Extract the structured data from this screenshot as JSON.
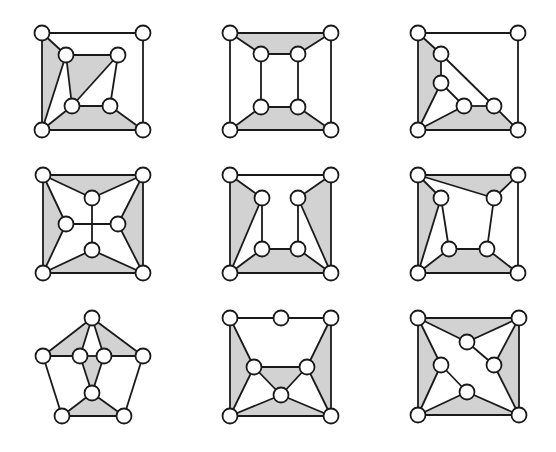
{
  "style": {
    "background": "#ffffff",
    "stroke": "#1a1a1a",
    "face_fill": "#d2d2d2",
    "node_fill": "#ffffff",
    "node_radius": 7.5,
    "stroke_width": 1.8
  },
  "graphs": [
    {
      "id": "g1",
      "nodes": [
        [
          42,
          33
        ],
        [
          143,
          33
        ],
        [
          42,
          130
        ],
        [
          143,
          130
        ],
        [
          66,
          55
        ],
        [
          118,
          55
        ],
        [
          72,
          106
        ],
        [
          110,
          106
        ]
      ],
      "faces": [
        [
          0,
          4,
          2
        ],
        [
          4,
          5,
          6
        ],
        [
          2,
          6,
          7,
          3
        ]
      ],
      "edges": [
        [
          0,
          1
        ],
        [
          1,
          3
        ],
        [
          3,
          2
        ],
        [
          2,
          0
        ],
        [
          0,
          4
        ],
        [
          4,
          5
        ],
        [
          5,
          7
        ],
        [
          7,
          6
        ],
        [
          6,
          4
        ],
        [
          5,
          6
        ],
        [
          4,
          2
        ],
        [
          2,
          6
        ],
        [
          7,
          3
        ]
      ]
    },
    {
      "id": "g2",
      "nodes": [
        [
          230,
          33
        ],
        [
          331,
          33
        ],
        [
          230,
          130
        ],
        [
          331,
          130
        ],
        [
          261,
          54
        ],
        [
          298,
          54
        ],
        [
          261,
          107
        ],
        [
          298,
          107
        ]
      ],
      "faces": [
        [
          0,
          1,
          5,
          4
        ],
        [
          6,
          7,
          3,
          2
        ]
      ],
      "edges": [
        [
          0,
          1
        ],
        [
          1,
          3
        ],
        [
          3,
          2
        ],
        [
          2,
          0
        ],
        [
          0,
          4
        ],
        [
          1,
          5
        ],
        [
          4,
          5
        ],
        [
          4,
          6
        ],
        [
          5,
          7
        ],
        [
          6,
          7
        ],
        [
          6,
          2
        ],
        [
          7,
          3
        ]
      ]
    },
    {
      "id": "g3",
      "nodes": [
        [
          418,
          33
        ],
        [
          518,
          33
        ],
        [
          418,
          130
        ],
        [
          518,
          130
        ],
        [
          441,
          54
        ],
        [
          441,
          83
        ],
        [
          464,
          106
        ],
        [
          494,
          106
        ]
      ],
      "faces": [
        [
          0,
          4,
          5,
          2
        ],
        [
          2,
          6,
          7,
          3
        ]
      ],
      "edges": [
        [
          0,
          1
        ],
        [
          1,
          3
        ],
        [
          3,
          2
        ],
        [
          2,
          0
        ],
        [
          0,
          4
        ],
        [
          4,
          5
        ],
        [
          4,
          7
        ],
        [
          5,
          6
        ],
        [
          6,
          7
        ],
        [
          5,
          2
        ],
        [
          6,
          2
        ],
        [
          7,
          3
        ]
      ]
    },
    {
      "id": "g4",
      "nodes": [
        [
          43,
          175
        ],
        [
          143,
          175
        ],
        [
          43,
          273
        ],
        [
          143,
          273
        ],
        [
          92,
          198
        ],
        [
          66,
          224
        ],
        [
          118,
          224
        ],
        [
          92,
          250
        ]
      ],
      "faces": [
        [
          0,
          1,
          4
        ],
        [
          0,
          5,
          2
        ],
        [
          1,
          3,
          6
        ],
        [
          2,
          7,
          3
        ]
      ],
      "edges": [
        [
          0,
          1
        ],
        [
          1,
          3
        ],
        [
          3,
          2
        ],
        [
          2,
          0
        ],
        [
          0,
          4
        ],
        [
          1,
          4
        ],
        [
          0,
          5
        ],
        [
          2,
          5
        ],
        [
          1,
          6
        ],
        [
          3,
          6
        ],
        [
          2,
          7
        ],
        [
          3,
          7
        ],
        [
          4,
          7
        ],
        [
          5,
          6
        ]
      ]
    },
    {
      "id": "g5",
      "nodes": [
        [
          230,
          175
        ],
        [
          331,
          175
        ],
        [
          230,
          273
        ],
        [
          331,
          273
        ],
        [
          262,
          198
        ],
        [
          298,
          198
        ],
        [
          262,
          249
        ],
        [
          298,
          249
        ]
      ],
      "faces": [
        [
          0,
          4,
          2
        ],
        [
          1,
          3,
          5
        ],
        [
          2,
          6,
          7,
          3
        ]
      ],
      "edges": [
        [
          0,
          1
        ],
        [
          1,
          3
        ],
        [
          3,
          2
        ],
        [
          2,
          0
        ],
        [
          0,
          4
        ],
        [
          1,
          5
        ],
        [
          4,
          6
        ],
        [
          5,
          7
        ],
        [
          6,
          7
        ],
        [
          4,
          2
        ],
        [
          5,
          3
        ],
        [
          6,
          2
        ],
        [
          7,
          3
        ]
      ]
    },
    {
      "id": "g6",
      "nodes": [
        [
          418,
          175
        ],
        [
          518,
          175
        ],
        [
          418,
          273
        ],
        [
          518,
          273
        ],
        [
          441,
          198
        ],
        [
          494,
          198
        ],
        [
          449,
          249
        ],
        [
          487,
          249
        ]
      ],
      "faces": [
        [
          0,
          1,
          5
        ],
        [
          0,
          4,
          2
        ],
        [
          2,
          6,
          7,
          3
        ]
      ],
      "edges": [
        [
          0,
          1
        ],
        [
          1,
          3
        ],
        [
          3,
          2
        ],
        [
          2,
          0
        ],
        [
          0,
          4
        ],
        [
          0,
          5
        ],
        [
          1,
          5
        ],
        [
          4,
          2
        ],
        [
          4,
          6
        ],
        [
          5,
          7
        ],
        [
          6,
          7
        ],
        [
          6,
          2
        ],
        [
          7,
          3
        ]
      ]
    },
    {
      "id": "g7",
      "nodes": [
        [
          92,
          318
        ],
        [
          43,
          356
        ],
        [
          143,
          356
        ],
        [
          62,
          416
        ],
        [
          124,
          416
        ],
        [
          80,
          356
        ],
        [
          104,
          356
        ],
        [
          92,
          393
        ]
      ],
      "faces": [
        [
          0,
          5,
          1
        ],
        [
          0,
          2,
          6
        ],
        [
          5,
          6,
          7
        ],
        [
          3,
          7,
          4
        ]
      ],
      "edges": [
        [
          0,
          1
        ],
        [
          0,
          2
        ],
        [
          1,
          3
        ],
        [
          2,
          4
        ],
        [
          3,
          4
        ],
        [
          0,
          5
        ],
        [
          0,
          6
        ],
        [
          1,
          5
        ],
        [
          5,
          6
        ],
        [
          6,
          2
        ],
        [
          5,
          7
        ],
        [
          6,
          7
        ],
        [
          7,
          3
        ],
        [
          7,
          4
        ]
      ]
    },
    {
      "id": "g8",
      "nodes": [
        [
          230,
          318
        ],
        [
          331,
          318
        ],
        [
          230,
          416
        ],
        [
          331,
          416
        ],
        [
          281,
          318
        ],
        [
          254,
          367
        ],
        [
          307,
          367
        ],
        [
          281,
          395
        ]
      ],
      "faces": [
        [
          0,
          5,
          2
        ],
        [
          1,
          3,
          6
        ],
        [
          5,
          6,
          7
        ],
        [
          2,
          7,
          3
        ]
      ],
      "edges": [
        [
          0,
          4
        ],
        [
          4,
          1
        ],
        [
          1,
          3
        ],
        [
          3,
          2
        ],
        [
          2,
          0
        ],
        [
          0,
          5
        ],
        [
          1,
          6
        ],
        [
          5,
          6
        ],
        [
          5,
          7
        ],
        [
          6,
          7
        ],
        [
          5,
          2
        ],
        [
          6,
          3
        ],
        [
          7,
          2
        ],
        [
          7,
          3
        ]
      ]
    },
    {
      "id": "g9",
      "nodes": [
        [
          418,
          318
        ],
        [
          519,
          318
        ],
        [
          418,
          415
        ],
        [
          519,
          415
        ],
        [
          467,
          342
        ],
        [
          441,
          365
        ],
        [
          494,
          365
        ],
        [
          467,
          392
        ]
      ],
      "faces": [
        [
          0,
          1,
          4
        ],
        [
          0,
          5,
          2
        ],
        [
          1,
          3,
          6
        ],
        [
          2,
          7,
          3
        ]
      ],
      "edges": [
        [
          0,
          1
        ],
        [
          1,
          3
        ],
        [
          3,
          2
        ],
        [
          2,
          0
        ],
        [
          0,
          4
        ],
        [
          1,
          4
        ],
        [
          4,
          6
        ],
        [
          1,
          6
        ],
        [
          3,
          6
        ],
        [
          0,
          5
        ],
        [
          2,
          5
        ],
        [
          5,
          7
        ],
        [
          2,
          7
        ],
        [
          3,
          7
        ]
      ]
    }
  ]
}
